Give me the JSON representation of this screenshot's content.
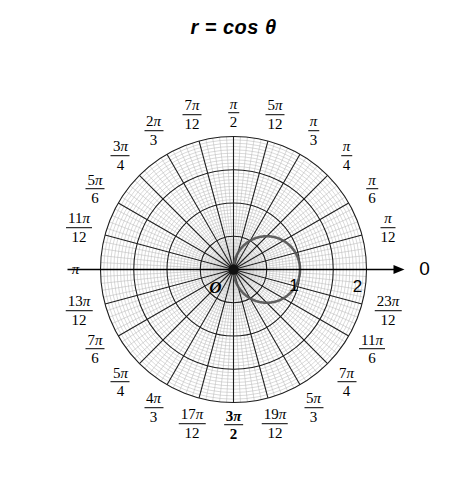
{
  "title": "r = cos θ",
  "chart_data": {
    "type": "line",
    "plot_kind": "polar",
    "title": "r = cos θ",
    "equation": "r = cos θ",
    "grid": true,
    "grid_spokes": 24,
    "grid_spoke_step": "π/12",
    "rings_major": [
      0.5,
      1,
      1.5,
      2
    ],
    "r_max": 2,
    "r_axis_ticks": [
      "1",
      "2"
    ],
    "theta_range": [
      0,
      6.2832
    ],
    "curve": {
      "name": "r = cos θ",
      "theta": [
        0,
        0.2618,
        0.5236,
        0.7854,
        1.0472,
        1.309,
        1.5708,
        1.8326,
        2.0944,
        2.3562,
        2.618,
        2.8798,
        3.1416
      ],
      "r": [
        1.0,
        0.9659,
        0.866,
        0.7071,
        0.5,
        0.2588,
        0.0,
        -0.2588,
        -0.5,
        -0.7071,
        -0.866,
        -0.9659,
        -1.0
      ]
    },
    "angle_labels": [
      {
        "label": "0",
        "numerator": "",
        "denominator": "",
        "angle_deg": 0,
        "bold": false
      },
      {
        "label": "π/12",
        "numerator": "π",
        "denominator": "12",
        "angle_deg": 15,
        "bold": false
      },
      {
        "label": "π/6",
        "numerator": "π",
        "denominator": "6",
        "angle_deg": 30,
        "bold": false
      },
      {
        "label": "π/4",
        "numerator": "π",
        "denominator": "4",
        "angle_deg": 45,
        "bold": false
      },
      {
        "label": "π/3",
        "numerator": "π",
        "denominator": "3",
        "angle_deg": 60,
        "bold": false
      },
      {
        "label": "5π/12",
        "numerator": "5π",
        "denominator": "12",
        "angle_deg": 75,
        "bold": false
      },
      {
        "label": "π/2",
        "numerator": "π",
        "denominator": "2",
        "angle_deg": 90,
        "bold": false
      },
      {
        "label": "7π/12",
        "numerator": "7π",
        "denominator": "12",
        "angle_deg": 105,
        "bold": false
      },
      {
        "label": "2π/3",
        "numerator": "2π",
        "denominator": "3",
        "angle_deg": 120,
        "bold": false
      },
      {
        "label": "3π/4",
        "numerator": "3π",
        "denominator": "4",
        "angle_deg": 135,
        "bold": false
      },
      {
        "label": "5π/6",
        "numerator": "5π",
        "denominator": "6",
        "angle_deg": 150,
        "bold": false
      },
      {
        "label": "11π/12",
        "numerator": "11π",
        "denominator": "12",
        "angle_deg": 165,
        "bold": false
      },
      {
        "label": "π",
        "numerator": "π",
        "denominator": "",
        "angle_deg": 180,
        "bold": false
      },
      {
        "label": "13π/12",
        "numerator": "13π",
        "denominator": "12",
        "angle_deg": 195,
        "bold": false
      },
      {
        "label": "7π/6",
        "numerator": "7π",
        "denominator": "6",
        "angle_deg": 210,
        "bold": false
      },
      {
        "label": "5π/4",
        "numerator": "5π",
        "denominator": "4",
        "angle_deg": 225,
        "bold": false
      },
      {
        "label": "4π/3",
        "numerator": "4π",
        "denominator": "3",
        "angle_deg": 240,
        "bold": false
      },
      {
        "label": "17π/12",
        "numerator": "17π",
        "denominator": "12",
        "angle_deg": 255,
        "bold": false
      },
      {
        "label": "3π/2",
        "numerator": "3π",
        "denominator": "2",
        "angle_deg": 270,
        "bold": true
      },
      {
        "label": "19π/12",
        "numerator": "19π",
        "denominator": "12",
        "angle_deg": 285,
        "bold": false
      },
      {
        "label": "5π/3",
        "numerator": "5π",
        "denominator": "3",
        "angle_deg": 300,
        "bold": false
      },
      {
        "label": "7π/4",
        "numerator": "7π",
        "denominator": "4",
        "angle_deg": 315,
        "bold": false
      },
      {
        "label": "11π/6",
        "numerator": "11π",
        "denominator": "6",
        "angle_deg": 330,
        "bold": false
      },
      {
        "label": "23π/12",
        "numerator": "23π",
        "denominator": "12",
        "angle_deg": 345,
        "bold": false
      }
    ],
    "annotations": [
      {
        "name": "origin",
        "text": "O"
      },
      {
        "name": "r-tick-1",
        "text": "1"
      },
      {
        "name": "r-tick-2",
        "text": "2"
      },
      {
        "name": "polar-axis",
        "text": "0"
      }
    ],
    "colors": {
      "curve": "#555555",
      "major_grid": "#1a1a1a",
      "minor_grid": "#b9b9b9",
      "axis": "#000000",
      "background": "#ffffff",
      "text": "#000000"
    }
  }
}
